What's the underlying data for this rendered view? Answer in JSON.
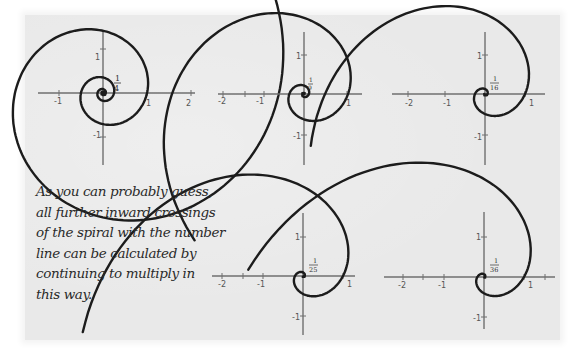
{
  "caption": {
    "lines": [
      "As you can probably guess,",
      "all further inward crossings",
      "of the spiral with the number",
      "line can be calculated by",
      "continuing to multiply in",
      "this way."
    ]
  },
  "panels": [
    {
      "id": "p1",
      "fraction_num": "1",
      "fraction_den": "4",
      "ratio": 4,
      "cx": 103,
      "cy": 93,
      "scale": 44,
      "x_ticks": [
        "-1",
        "1",
        "2"
      ],
      "y_ticks": [
        "1",
        "-1"
      ]
    },
    {
      "id": "p2",
      "fraction_num": "1",
      "fraction_den": "9",
      "ratio": 9,
      "cx": 304,
      "cy": 94,
      "scale": 44,
      "x_ticks": [
        "-2",
        "-1",
        "1"
      ],
      "y_ticks": [
        "1",
        "-1"
      ]
    },
    {
      "id": "p3",
      "fraction_num": "1",
      "fraction_den": "16",
      "ratio": 16,
      "cx": 485,
      "cy": 94,
      "scale": 40,
      "x_ticks": [
        "-2",
        "-1",
        "1"
      ],
      "y_ticks": [
        "1",
        "-1"
      ]
    },
    {
      "id": "p4",
      "fraction_num": "1",
      "fraction_den": "25",
      "ratio": 25,
      "cx": 303,
      "cy": 276,
      "scale": 40,
      "x_ticks": [
        "-2",
        "-1",
        "1"
      ],
      "y_ticks": [
        "1",
        "-1"
      ]
    },
    {
      "id": "p5",
      "fraction_num": "1",
      "fraction_den": "36",
      "ratio": 36,
      "cx": 484,
      "cy": 277,
      "scale": 40,
      "x_ticks": [
        "-2",
        "-1",
        "1"
      ],
      "y_ticks": [
        "1",
        "-1"
      ]
    }
  ],
  "colors": {
    "paper": "#e9e9e9",
    "ink": "#1c1c1c",
    "axis": "#6f6f6f"
  }
}
